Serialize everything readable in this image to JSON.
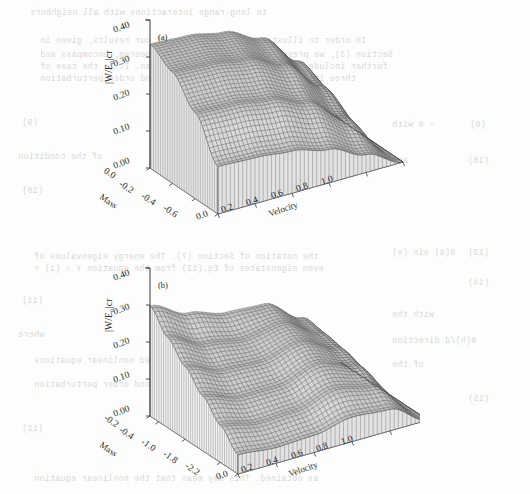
{
  "page": {
    "background_color": "#fdfdfd",
    "ink_color": "#2b2b2b",
    "bleed_color": "#c0c0c0",
    "width": 530,
    "height": 494
  },
  "bleed_text": {
    "note": "faint mirrored show-through text from the reverse side of the scanned page",
    "lines": [
      {
        "text": "to long-range interactions with all neighbors",
        "x": 30,
        "y": 8,
        "mirrored": true
      },
      {
        "text": "In order to illustrate the generality of our results, given in",
        "x": 40,
        "y": 36,
        "mirrored": true
      },
      {
        "text": "Section (3), we present here the local no go theorem, encompass and",
        "x": 40,
        "y": 50,
        "mirrored": true
      },
      {
        "text": "further include interactions in the Hamiltonian. It is the case of",
        "x": 40,
        "y": 62,
        "mirrored": true
      },
      {
        "text": "three interactions one may for the second order perturbation",
        "x": 40,
        "y": 74,
        "mirrored": true
      },
      {
        "text": "(9)",
        "x": 22,
        "y": 118,
        "mirrored": true
      },
      {
        "text": "of the condition",
        "x": 18,
        "y": 152,
        "mirrored": true
      },
      {
        "text": "(10)",
        "x": 22,
        "y": 186,
        "mirrored": true
      },
      {
        "text": "the notation of Section (7). The energy eigenvalues of",
        "x": 34,
        "y": 252,
        "mirrored": true
      },
      {
        "text": "even eigenstates of Eq.(12) from the equation Y = (1) +",
        "x": 34,
        "y": 264,
        "mirrored": true
      },
      {
        "text": "(11)",
        "x": 22,
        "y": 296,
        "mirrored": true
      },
      {
        "text": "where",
        "x": 18,
        "y": 330,
        "mirrored": true
      },
      {
        "text": "directly expressed as generalized nonlinear equations",
        "x": 34,
        "y": 356,
        "mirrored": true
      },
      {
        "text": "in the form of the second order perturbation",
        "x": 34,
        "y": 380,
        "mirrored": true
      },
      {
        "text": "(12)",
        "x": 22,
        "y": 424,
        "mirrored": true
      },
      {
        "text": "as obtained. This may mean that the nonlinear equation",
        "x": 34,
        "y": 474,
        "mirrored": true
      }
    ],
    "right_column_lines": [
      {
        "text": "= 0   with",
        "x": 392,
        "y": 120,
        "mirrored": true
      },
      {
        "text": "(9)",
        "x": 470,
        "y": 120,
        "mirrored": true
      },
      {
        "text": "and",
        "x": 392,
        "y": 156,
        "mirrored": true
      },
      {
        "text": "(10)",
        "x": 468,
        "y": 156,
        "mirrored": true
      },
      {
        "text": "0(a)   sin (x)",
        "x": 392,
        "y": 248,
        "mirrored": true
      },
      {
        "text": "(13)",
        "x": 468,
        "y": 248,
        "mirrored": true
      },
      {
        "text": "(14)",
        "x": 468,
        "y": 278,
        "mirrored": true
      },
      {
        "text": "with the",
        "x": 392,
        "y": 310,
        "mirrored": true
      },
      {
        "text": "0(h)/d   direction",
        "x": 392,
        "y": 336,
        "mirrored": true
      },
      {
        "text": "of the",
        "x": 392,
        "y": 360,
        "mirrored": true
      },
      {
        "text": "(15)",
        "x": 468,
        "y": 394,
        "mirrored": true
      }
    ]
  },
  "figure": {
    "type": "surface-plot-pair",
    "panels": [
      {
        "id": "panel-a",
        "label": "(a)",
        "zlabel": "|W/E₀|cr",
        "zticks": [
          "0.00",
          "0.10",
          "0.20",
          "0.30",
          "0.40"
        ],
        "zlim": [
          0.0,
          0.4
        ],
        "xlabel": "Velocity",
        "xticks": [
          "0.0",
          "0.2",
          "0.4",
          "0.6",
          "0.8",
          "1.0"
        ],
        "xlim": [
          0.0,
          1.0
        ],
        "ylabel": "Mass",
        "yticks": [
          "0.0",
          "-0.2",
          "-0.4",
          "-0.6"
        ],
        "ylim": [
          -0.6,
          0.0
        ]
      },
      {
        "id": "panel-b",
        "label": "(b)",
        "zlabel": "|W/E₀|cr",
        "zticks": [
          "0.00",
          "0.10",
          "0.20",
          "0.30",
          "0.40"
        ],
        "zlim": [
          0.0,
          0.4
        ],
        "xlabel": "Velocity",
        "xticks": [
          "0.0",
          "0.2",
          "0.4",
          "0.6",
          "0.8",
          "1.0"
        ],
        "xlim": [
          0.0,
          1.0
        ],
        "ylabel": "Mass",
        "yticks": [
          "-0.2",
          "-0.4",
          "-1.0",
          "-1.8",
          "-2.2"
        ],
        "ylim": [
          -2.2,
          -0.2
        ]
      }
    ]
  },
  "chart_data": [
    {
      "type": "surface",
      "panel": "(a)",
      "title": "",
      "xlabel": "Velocity",
      "ylabel": "Mass",
      "zlabel": "|W/E₀|cr",
      "xlim": [
        0.0,
        1.0
      ],
      "ylim": [
        -0.6,
        0.0
      ],
      "zlim": [
        0.0,
        0.4
      ],
      "xticks": [
        0.0,
        0.2,
        0.4,
        0.6,
        0.8,
        1.0
      ],
      "yticks": [
        0.0,
        -0.2,
        -0.4,
        -0.6
      ],
      "zticks": [
        0.0,
        0.1,
        0.2,
        0.3,
        0.4
      ],
      "grid": false,
      "legend": "none",
      "x": [
        0.0,
        0.2,
        0.4,
        0.6,
        0.8,
        1.0
      ],
      "y": [
        0.0,
        -0.2,
        -0.4,
        -0.6
      ],
      "z": [
        [
          0.335,
          0.33,
          0.312,
          0.268,
          0.178,
          0.0
        ],
        [
          0.3,
          0.296,
          0.28,
          0.238,
          0.152,
          0.0
        ],
        [
          0.232,
          0.228,
          0.214,
          0.178,
          0.108,
          0.0
        ],
        [
          0.128,
          0.124,
          0.114,
          0.09,
          0.048,
          0.0
        ]
      ],
      "description": "Monotonically decaying surface: maximum about 0.34 at Velocity 0, Mass 0; falls to zero along the Velocity = 1 edge and decreases toward more negative Mass."
    },
    {
      "type": "surface",
      "panel": "(b)",
      "title": "",
      "xlabel": "Velocity",
      "ylabel": "Mass",
      "zlabel": "|W/E₀|cr",
      "xlim": [
        0.0,
        1.0
      ],
      "ylim": [
        -2.2,
        -0.2
      ],
      "zlim": [
        0.0,
        0.4
      ],
      "xticks": [
        0.0,
        0.2,
        0.4,
        0.6,
        0.8,
        1.0
      ],
      "yticks": [
        -0.2,
        -0.4,
        -1.0,
        -1.8,
        -2.2
      ],
      "zticks": [
        0.0,
        0.1,
        0.2,
        0.3,
        0.4
      ],
      "grid": false,
      "legend": "none",
      "x": [
        0.0,
        0.2,
        0.4,
        0.6,
        0.8,
        1.0
      ],
      "y": [
        -0.2,
        -0.6,
        -1.0,
        -1.4,
        -1.8,
        -2.2
      ],
      "z": [
        [
          0.298,
          0.25,
          0.222,
          0.216,
          0.15,
          0.0
        ],
        [
          0.244,
          0.198,
          0.182,
          0.196,
          0.142,
          0.0
        ],
        [
          0.196,
          0.158,
          0.152,
          0.176,
          0.132,
          0.0
        ],
        [
          0.148,
          0.118,
          0.118,
          0.148,
          0.116,
          0.0
        ],
        [
          0.1,
          0.08,
          0.084,
          0.112,
          0.092,
          0.0
        ],
        [
          0.052,
          0.042,
          0.046,
          0.066,
          0.058,
          0.0
        ]
      ],
      "description": "Surface with a saddle: a peak near 0.30 at Velocity 0, a shallow trough near Velocity 0.35, a secondary ridge near Velocity 0.65, then a sharp drop to zero at the Velocity = 1 edge."
    }
  ]
}
